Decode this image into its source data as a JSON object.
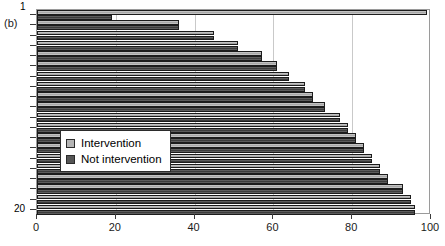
{
  "panel": {
    "label": "(b)"
  },
  "legend": {
    "items": [
      {
        "key": "intervention",
        "label": "Intervention",
        "color": "#b4b4b4"
      },
      {
        "key": "not_intervention",
        "label": "Not intervention",
        "color": "#555555"
      }
    ]
  },
  "axes": {
    "x": {
      "ticks": [
        0,
        20,
        40,
        60,
        80,
        100
      ],
      "min": 0,
      "max": 100,
      "label": ""
    },
    "y": {
      "min": 1,
      "max": 20,
      "top_label": "1",
      "bottom_label": "20",
      "label": ""
    }
  },
  "chart_data": {
    "type": "bar",
    "orientation": "horizontal",
    "title": "",
    "xlabel": "",
    "ylabel": "",
    "xlim": [
      0,
      100
    ],
    "ylim": [
      1,
      20
    ],
    "grid": true,
    "legend_position": "center-left",
    "categories": [
      "1",
      "2",
      "3",
      "4",
      "5",
      "6",
      "7",
      "8",
      "9",
      "10",
      "11",
      "12",
      "13",
      "14",
      "15",
      "16",
      "17",
      "18",
      "19",
      "20"
    ],
    "series": [
      {
        "name": "Not intervention",
        "color": "#555555",
        "values": [
          19,
          36,
          45,
          51,
          57,
          61,
          64,
          68,
          70,
          73,
          77,
          79,
          81,
          83,
          85,
          87,
          89,
          93,
          95,
          96
        ]
      },
      {
        "name": "Intervention",
        "color": "#b4b4b4",
        "values": [
          99,
          36,
          45,
          51,
          57,
          61,
          64,
          68,
          70,
          73,
          77,
          79,
          81,
          83,
          85,
          87,
          89,
          93,
          95,
          96
        ]
      }
    ]
  }
}
